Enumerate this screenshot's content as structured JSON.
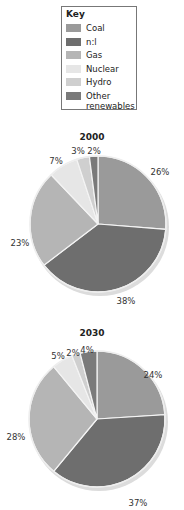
{
  "legend": {
    "title": "Key",
    "items": [
      {
        "label": "Coal",
        "color": "#9a9a9a"
      },
      {
        "label": "n:l",
        "color": "#6e6e6e"
      },
      {
        "label": "Gas",
        "color": "#b5b5b5"
      },
      {
        "label": "Nuclear",
        "color": "#e6e6e6"
      },
      {
        "label": "Hydro",
        "color": "#cfcfcf"
      },
      {
        "label": "Other renewables",
        "color": "#7a7a7a"
      }
    ]
  },
  "chart_data": [
    {
      "type": "pie",
      "title": "2000",
      "categories": [
        "Coal",
        "Oil",
        "Gas",
        "Nuclear",
        "Hydro",
        "Other renewables"
      ],
      "values": [
        26,
        38,
        23,
        7,
        3,
        2
      ],
      "labels": [
        "26%",
        "38%",
        "23%",
        "7%",
        "3%",
        "2%"
      ]
    },
    {
      "type": "pie",
      "title": "2030",
      "categories": [
        "Coal",
        "Oil",
        "Gas",
        "Nuclear",
        "Hydro",
        "Other renewables"
      ],
      "values": [
        24,
        37,
        28,
        5,
        2,
        4
      ],
      "labels": [
        "24%",
        "37%",
        "28%",
        "5%",
        "2%",
        "4%"
      ]
    }
  ]
}
